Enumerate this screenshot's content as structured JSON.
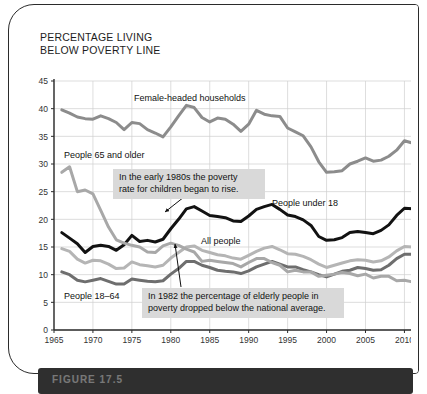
{
  "figure": {
    "title": "PERCENTAGE LIVING\nBELOW POVERTY LINE",
    "caption": "FIGURE 17.5"
  },
  "annotations": [
    {
      "id": "children",
      "text": "In the early 1980s the poverty\nrate for children began to rise.",
      "arrow_from": [
        175,
        192
      ],
      "arrow_to": [
        156,
        207
      ]
    },
    {
      "id": "elderly",
      "text": "In 1982 the percentage of elderly people in\npoverty dropped below the national average.",
      "arrow_from": [
        172,
        282
      ],
      "arrow_to": [
        166,
        239
      ]
    }
  ],
  "series_labels": [
    {
      "id": "female-headed-households",
      "text": "Female-headed households",
      "x": 125,
      "y": 96
    },
    {
      "id": "people-65-and-older",
      "text": "People 65 and older",
      "x": 55,
      "y": 153
    },
    {
      "id": "people-under-18",
      "text": "People under 18",
      "x": 263,
      "y": 201
    },
    {
      "id": "all-people",
      "text": "All people",
      "x": 192,
      "y": 239
    },
    {
      "id": "people-18-64",
      "text": "People 18–64",
      "x": 55,
      "y": 294
    }
  ],
  "colors": {
    "female_headed": "#8c8c8c",
    "under18": "#121212",
    "all_people": "#b5b5b5",
    "age18_64": "#6e6e6e",
    "age65_plus": "#a8a8a8",
    "grid": "#cfcfcf",
    "axis": "#2b2b2b",
    "callout_bg": "#d9d9d9",
    "caption_bar": "#2f2f2f"
  },
  "chart_data": {
    "type": "line",
    "title": "PERCENTAGE LIVING BELOW POVERTY LINE",
    "xlabel": "",
    "ylabel": "",
    "xlim": [
      1965,
      2012
    ],
    "ylim": [
      0,
      45
    ],
    "grid": true,
    "legend": "inline-labels",
    "xticks": [
      1965,
      1970,
      1975,
      1980,
      1985,
      1990,
      1995,
      2000,
      2005,
      2010
    ],
    "yticks": [
      0,
      5,
      10,
      15,
      20,
      25,
      30,
      35,
      40,
      45
    ],
    "x": [
      1966,
      1967,
      1968,
      1969,
      1970,
      1971,
      1972,
      1973,
      1974,
      1975,
      1976,
      1977,
      1978,
      1979,
      1980,
      1981,
      1982,
      1983,
      1984,
      1985,
      1986,
      1987,
      1988,
      1989,
      1990,
      1991,
      1992,
      1993,
      1994,
      1995,
      1996,
      1997,
      1998,
      1999,
      2000,
      2001,
      2002,
      2003,
      2004,
      2005,
      2006,
      2007,
      2008,
      2009,
      2010,
      2011
    ],
    "series": [
      {
        "name": "Female-headed households",
        "color": "#8c8c8c",
        "values": [
          39.8,
          39.2,
          38.5,
          38.2,
          38.1,
          38.7,
          38.2,
          37.5,
          36.2,
          37.5,
          37.3,
          36.2,
          35.6,
          34.9,
          36.7,
          38.7,
          40.6,
          40.2,
          38.4,
          37.6,
          38.3,
          38.1,
          37.2,
          35.9,
          37.2,
          39.7,
          39.0,
          38.7,
          38.6,
          36.5,
          35.8,
          35.1,
          33.1,
          30.4,
          28.5,
          28.6,
          28.8,
          30.0,
          30.5,
          31.1,
          30.5,
          30.7,
          31.4,
          32.5,
          34.2,
          33.8
        ]
      },
      {
        "name": "People under 18",
        "color": "#121212",
        "values": [
          17.6,
          16.6,
          15.6,
          14.0,
          15.1,
          15.3,
          15.1,
          14.4,
          15.4,
          17.1,
          16.0,
          16.2,
          15.9,
          16.4,
          18.3,
          20.0,
          21.9,
          22.3,
          21.5,
          20.7,
          20.5,
          20.3,
          19.7,
          19.6,
          20.6,
          21.8,
          22.3,
          22.7,
          21.8,
          20.8,
          20.5,
          19.9,
          18.9,
          16.9,
          16.2,
          16.3,
          16.7,
          17.6,
          17.8,
          17.6,
          17.4,
          18.0,
          19.0,
          20.7,
          22.0,
          21.9
        ]
      },
      {
        "name": "All people",
        "color": "#b5b5b5",
        "values": [
          14.7,
          14.2,
          12.8,
          12.1,
          12.6,
          12.5,
          11.9,
          11.1,
          11.2,
          12.3,
          11.8,
          11.6,
          11.4,
          11.7,
          13.0,
          14.0,
          15.0,
          15.2,
          14.4,
          14.0,
          13.6,
          13.4,
          13.0,
          12.8,
          13.5,
          14.2,
          14.8,
          15.1,
          14.5,
          13.8,
          13.7,
          13.3,
          12.7,
          11.9,
          11.3,
          11.7,
          12.1,
          12.5,
          12.7,
          12.6,
          12.3,
          12.5,
          13.2,
          14.3,
          15.1,
          15.0
        ]
      },
      {
        "name": "People 18–64",
        "color": "#6e6e6e",
        "values": [
          10.5,
          10.0,
          9.0,
          8.7,
          9.0,
          9.3,
          8.8,
          8.3,
          8.3,
          9.2,
          9.0,
          8.8,
          8.7,
          8.9,
          10.1,
          11.1,
          12.4,
          12.4,
          11.7,
          11.3,
          10.8,
          10.6,
          10.5,
          10.2,
          10.7,
          11.4,
          11.9,
          12.4,
          11.9,
          11.4,
          11.4,
          10.9,
          10.5,
          10.0,
          9.6,
          10.1,
          10.6,
          10.8,
          11.3,
          11.1,
          10.8,
          10.9,
          11.7,
          12.9,
          13.7,
          13.7
        ]
      },
      {
        "name": "People 65 and older",
        "color": "#a8a8a8",
        "values": [
          28.5,
          29.5,
          25.0,
          25.3,
          24.6,
          21.6,
          18.6,
          16.3,
          15.7,
          15.3,
          15.0,
          14.1,
          14.0,
          15.2,
          15.7,
          15.3,
          14.6,
          14.1,
          12.4,
          12.6,
          12.4,
          12.2,
          12.0,
          11.4,
          12.2,
          12.9,
          12.9,
          12.2,
          11.7,
          10.5,
          10.8,
          10.5,
          10.5,
          9.7,
          9.9,
          10.1,
          10.4,
          10.2,
          9.8,
          10.1,
          9.4,
          9.7,
          9.7,
          8.9,
          9.0,
          8.7
        ]
      }
    ]
  }
}
